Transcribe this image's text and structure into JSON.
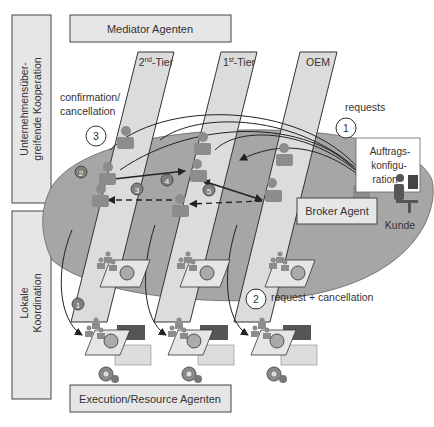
{
  "side_labels": {
    "upper": {
      "line1": "Unternehmensüber-",
      "line2": "greifende Kooperation"
    },
    "lower": {
      "line1": "Lokale",
      "line2": "Koordination"
    }
  },
  "boxes": {
    "mediator": "Mediator Agenten",
    "execution": "Execution/Resource Agenten",
    "broker": "Broker Agent",
    "order_config": {
      "line1": "Auftrags-",
      "line2": "konfigu-",
      "line3": "ration"
    }
  },
  "tiers": [
    {
      "base": "2",
      "sup": "nd",
      "suffix": "-Tier"
    },
    {
      "base": "1",
      "sup": "st",
      "suffix": "-Tier"
    },
    {
      "base": "OEM",
      "sup": "",
      "suffix": ""
    }
  ],
  "annotations": {
    "confirmation": {
      "line1": "confirmation/",
      "line2": "cancellation"
    },
    "requests": "requests",
    "request_cancellation": "request + cancellation",
    "customer": "Kunde"
  },
  "step_circles": {
    "one": "1",
    "two": "2",
    "three": "3"
  },
  "step_badges": [
    "1",
    "2",
    "3",
    "4",
    "5"
  ],
  "colors": {
    "box_fill": "#e6e6e6",
    "strip_fill": "#dcdcdc",
    "ellipse_fill": "#a6a6a6",
    "agent_fill": "#8c8c8c",
    "badge_fill": "#808080",
    "stroke": "#333333"
  }
}
